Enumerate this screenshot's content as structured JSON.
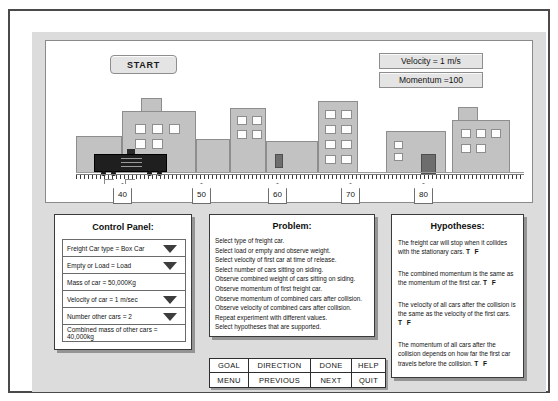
{
  "simulation": {
    "start_label": "START",
    "velocity_readout": "Velocity = 1 m/s",
    "momentum_readout": "Momentum =100",
    "markers": [
      "40",
      "50",
      "60",
      "70",
      "80"
    ]
  },
  "control_panel": {
    "title": "Control Panel:",
    "rows": [
      {
        "label": "Freight Car type = Box Car",
        "dropdown": true
      },
      {
        "label": "Empty or Load = Load",
        "dropdown": true
      },
      {
        "label": "Mass of car = 50,000Kg",
        "dropdown": false
      },
      {
        "label": "Velocity of car = 1 m/sec",
        "dropdown": true
      },
      {
        "label": "Number other cars = 2",
        "dropdown": true
      },
      {
        "label": "Combined mass of other cars = 40,000kg",
        "dropdown": false
      }
    ]
  },
  "problem": {
    "title": "Problem:",
    "lines": [
      "Select type of freight car.",
      "Select load or empty and observe weight.",
      "Select velocity of first car at time of release.",
      "Select number of cars sitting on siding.",
      "Observe combined weight of cars sitting on siding.",
      "Observe momentum of first freight car.",
      "Observe momentum of combined cars after collision.",
      "Observe velocity of combined cars after collision.",
      "Repeat experiment with different values.",
      "Select hypotheses that are supported."
    ]
  },
  "hypotheses": {
    "title": "Hypotheses:",
    "tf_label": "T F",
    "items": [
      "The freight car will stop when it collides with the stationary cars.",
      "The combined  momentum is the same as the  momentum of the first car.",
      "The velocity of all cars after the collision is the same as the velocity of the first cars.",
      "The  momentum of all cars after the collision depends on how far the first car travels before the collision."
    ]
  },
  "buttons": [
    "GOAL",
    "DIRECTION",
    "DONE",
    "HELP",
    "MENU",
    "PREVIOUS",
    "NEXT",
    "QUIT"
  ]
}
